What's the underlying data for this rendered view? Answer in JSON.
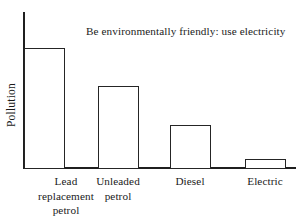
{
  "chart_data": {
    "type": "bar",
    "title": "Be environmentally friendly: use electricity",
    "xlabel": "",
    "ylabel": "Pollution",
    "grid": false,
    "legend": null,
    "axis_note": "y-axis unlabelled (no tick marks or numeric scale shown)",
    "categories": [
      "Lead replacement petrol",
      "Unleaded petrol",
      "Diesel",
      "Electric"
    ],
    "category_lines": [
      [
        "Lead",
        "replacement",
        "petrol"
      ],
      [
        "Unleaded",
        "petrol"
      ],
      [
        "Diesel"
      ],
      [
        "Electric"
      ]
    ],
    "values": [
      100,
      53,
      28,
      5
    ],
    "ylim": [
      0,
      108
    ],
    "value_units": "relative pollution (unitless)"
  },
  "colors": {
    "background": "#ffffff",
    "axis": "#1f1f1f",
    "bar_outline": "#252525",
    "bar_fill": "#ffffff",
    "text": "#1a1a1a"
  },
  "geometry": {
    "bars": [
      {
        "left": 24,
        "top": 48,
        "width": 41,
        "height": 121
      },
      {
        "left": 98,
        "top": 86,
        "width": 41,
        "height": 83
      },
      {
        "left": 170,
        "top": 125,
        "width": 41,
        "height": 44
      },
      {
        "left": 245,
        "top": 159,
        "width": 41,
        "height": 10
      }
    ],
    "label_centers": [
      66,
      118,
      190,
      265
    ]
  }
}
